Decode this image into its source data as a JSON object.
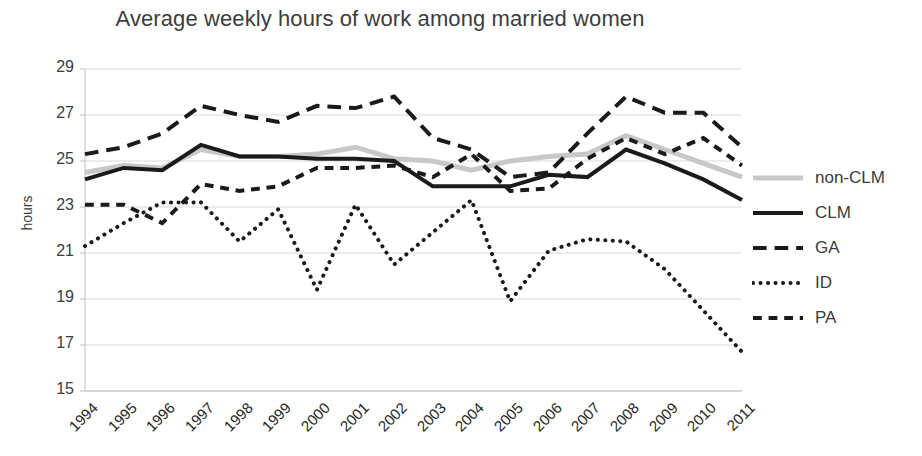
{
  "chart_data": {
    "type": "line",
    "title": "Average weekly hours of work among married women",
    "xlabel": "",
    "ylabel": "hours",
    "ylim": [
      15,
      29
    ],
    "ytick_step": 2,
    "yticks": [
      29,
      27,
      25,
      23,
      21,
      19,
      17,
      15
    ],
    "grid": true,
    "legend_position": "right",
    "categories": [
      "1994",
      "1995",
      "1996",
      "1997",
      "1998",
      "1999",
      "2000",
      "2001",
      "2002",
      "2003",
      "2004",
      "2005",
      "2006",
      "2007",
      "2008",
      "2009",
      "2010",
      "2011"
    ],
    "x": [
      1994,
      1995,
      1996,
      1997,
      1998,
      1999,
      2000,
      2001,
      2002,
      2003,
      2004,
      2005,
      2006,
      2007,
      2008,
      2009,
      2010,
      2011
    ],
    "series": [
      {
        "name": "non-CLM",
        "style": "solid",
        "color": "#c8c8c8",
        "width": 5,
        "values": [
          24.5,
          24.8,
          24.7,
          25.5,
          25.2,
          25.2,
          25.3,
          25.6,
          25.1,
          25.0,
          24.6,
          25.0,
          25.2,
          25.3,
          26.1,
          25.5,
          24.9,
          24.3
        ]
      },
      {
        "name": "CLM",
        "style": "solid",
        "color": "#1a1a1a",
        "width": 4,
        "values": [
          24.2,
          24.7,
          24.6,
          25.7,
          25.2,
          25.2,
          25.1,
          25.1,
          25.0,
          23.9,
          23.9,
          23.9,
          24.4,
          24.3,
          25.5,
          24.9,
          24.2,
          23.3
        ]
      },
      {
        "name": "GA",
        "style": "long-dash",
        "color": "#1a1a1a",
        "width": 4,
        "values": [
          25.3,
          25.6,
          26.2,
          27.4,
          27.0,
          26.7,
          27.4,
          27.3,
          27.8,
          26.0,
          25.5,
          24.3,
          24.5,
          26.2,
          27.8,
          27.1,
          27.1,
          25.6
        ]
      },
      {
        "name": "ID",
        "style": "dotted",
        "color": "#1a1a1a",
        "width": 4,
        "values": [
          21.3,
          22.3,
          23.2,
          23.2,
          21.5,
          22.9,
          19.4,
          23.1,
          20.5,
          21.9,
          23.3,
          18.9,
          21.1,
          21.6,
          21.5,
          20.3,
          18.5,
          16.7
        ]
      },
      {
        "name": "PA",
        "style": "dash",
        "color": "#1a1a1a",
        "width": 4,
        "values": [
          23.1,
          23.1,
          22.3,
          24.0,
          23.7,
          23.9,
          24.7,
          24.7,
          24.8,
          24.3,
          25.3,
          23.7,
          23.8,
          25.1,
          26.0,
          25.3,
          26.0,
          24.8
        ]
      }
    ]
  },
  "legend": {
    "items": [
      {
        "label": "non-CLM"
      },
      {
        "label": "CLM"
      },
      {
        "label": "GA"
      },
      {
        "label": "ID"
      },
      {
        "label": "PA"
      }
    ]
  }
}
